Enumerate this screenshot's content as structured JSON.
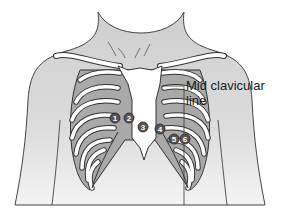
{
  "diagram": {
    "label": {
      "line1": "Mid clavicular",
      "line2": "line"
    },
    "electrodes": [
      {
        "id": "1",
        "x": 115,
        "y": 118
      },
      {
        "id": "2",
        "x": 129,
        "y": 118
      },
      {
        "id": "3",
        "x": 143,
        "y": 127
      },
      {
        "id": "4",
        "x": 160,
        "y": 129
      },
      {
        "id": "5",
        "x": 174,
        "y": 139
      },
      {
        "id": "6",
        "x": 185,
        "y": 139
      }
    ],
    "colors": {
      "skin": "#d9d9d9",
      "intercostal": "#a9a9a9",
      "bone": "#ffffff",
      "outline": "#333333",
      "electrode": "#555555"
    }
  }
}
